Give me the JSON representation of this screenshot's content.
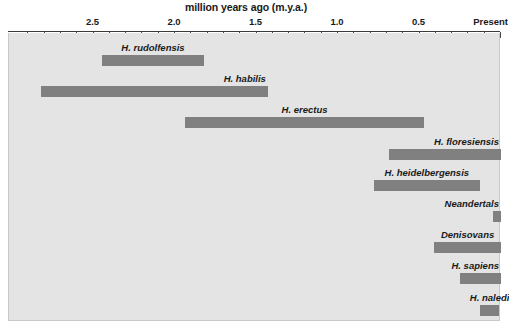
{
  "chart_data": {
    "type": "bar",
    "chart_kind": "horizontal-range-timeline",
    "title": "million years ago (m.y.a.)",
    "xlabel": "million years ago (m.y.a.)",
    "ylabel": "",
    "axis": {
      "orientation": "horizontal",
      "direction": "reversed",
      "xlim": [
        2.95,
        0.0
      ],
      "major_tick_interval": 0.5,
      "minor_tick_interval": 0.1,
      "grid": false,
      "tick_labels": [
        {
          "text": "2.5",
          "value": 2.5
        },
        {
          "text": "2.0",
          "value": 2.0
        },
        {
          "text": "1.5",
          "value": 1.5
        },
        {
          "text": "1.0",
          "value": 1.0
        },
        {
          "text": "0.5",
          "value": 0.5
        },
        {
          "text": "Present",
          "value": 0.0
        }
      ]
    },
    "legend": {
      "visible": false,
      "position": "none"
    },
    "bar_color": "#808080",
    "panel_color": "#e4e4e4",
    "axis_color": "#3b3b3b",
    "text_color": "#1a1a1a",
    "categories": [
      "H. rudolfensis",
      "H. habilis",
      "H. erectus",
      "H. floresiensis",
      "H. heidelbergensis",
      "Neandertals",
      "Denisovans",
      "H. sapiens",
      "H. naledi"
    ],
    "ranges": [
      {
        "label": "H. rudolfensis",
        "start_mya": 2.45,
        "end_mya": 1.82,
        "label_align": "center"
      },
      {
        "label": "H. habilis",
        "start_mya": 2.82,
        "end_mya": 1.43,
        "label_align": "right"
      },
      {
        "label": "H. erectus",
        "start_mya": 1.94,
        "end_mya": 0.47,
        "label_align": "center"
      },
      {
        "label": "H. floresiensis",
        "start_mya": 0.69,
        "end_mya": 0.0,
        "label_align": "right"
      },
      {
        "label": "H. heidelbergensis",
        "start_mya": 0.78,
        "end_mya": 0.13,
        "label_align": "center"
      },
      {
        "label": "Neandertals",
        "start_mya": 0.05,
        "end_mya": 0.0,
        "label_align": "right"
      },
      {
        "label": "Denisovans",
        "start_mya": 0.41,
        "end_mya": 0.0,
        "label_align": "center"
      },
      {
        "label": "H. sapiens",
        "start_mya": 0.25,
        "end_mya": 0.0,
        "label_align": "right"
      },
      {
        "label": "H. naledi",
        "start_mya": 0.13,
        "end_mya": 0.01,
        "label_align": "center"
      }
    ]
  }
}
